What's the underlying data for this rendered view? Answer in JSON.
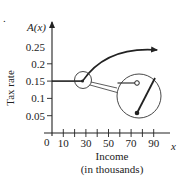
{
  "chart_data": {
    "type": "line",
    "title": "",
    "function_label": "A(x)",
    "xlabel_lines": [
      "Income",
      "(in thousands)"
    ],
    "ylabel": "Tax rate",
    "x_axis_var": "x",
    "origin_label": "0",
    "xlim": [
      0,
      100
    ],
    "ylim": [
      0,
      0.3
    ],
    "x_ticks": [
      10,
      20,
      30,
      40,
      50,
      60,
      70,
      80,
      90
    ],
    "x_tick_labels": [
      "10",
      "30",
      "50",
      "70",
      "90"
    ],
    "y_ticks": [
      0.05,
      0.1,
      0.15,
      0.2
    ],
    "y_tick_labels": [
      "0.05",
      "0.1",
      "0.15",
      "0.2",
      "0.25"
    ],
    "series": [
      {
        "name": "constant segment",
        "shape": "horizontal line",
        "points": [
          [
            0,
            0.15
          ],
          [
            27,
            0.15
          ]
        ]
      },
      {
        "name": "increasing curve",
        "shape": "concave-down curve with arrow",
        "points": [
          [
            27,
            0.15
          ],
          [
            40,
            0.195
          ],
          [
            55,
            0.225
          ],
          [
            70,
            0.245
          ],
          [
            93,
            0.24
          ]
        ]
      }
    ],
    "annotations": [
      {
        "type": "zoom-circle-small",
        "center": [
          27,
          0.15
        ]
      },
      {
        "type": "zoom-circle-large",
        "detail": "open endpoint of horizontal segment, closed endpoint of rising segment"
      }
    ],
    "grid": false,
    "legend": "none"
  },
  "page": {
    "cropped_mark": "."
  }
}
